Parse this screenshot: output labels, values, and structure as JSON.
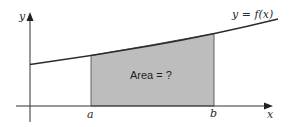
{
  "diagram": {
    "axes": {
      "x_label": "x",
      "y_label": "y"
    },
    "curve": {
      "label": "y = f(x)",
      "color": "#2b2b2b"
    },
    "bounds": {
      "lower": "a",
      "upper": "b"
    },
    "region": {
      "label": "Area = ?",
      "fill": "#bdbdbd",
      "stroke": "#555555"
    }
  }
}
